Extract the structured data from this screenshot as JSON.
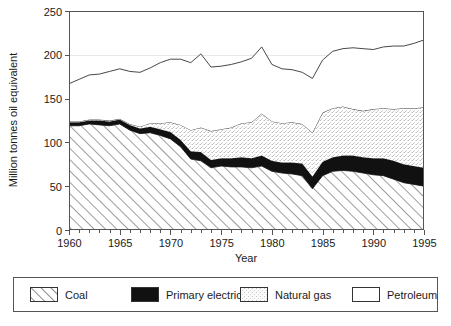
{
  "chart_data": {
    "type": "area",
    "stacked": true,
    "title": "",
    "xlabel": "Year",
    "ylabel": "Million tonnes oil equivalent",
    "xlim": [
      1960,
      1995
    ],
    "ylim": [
      0,
      250
    ],
    "ytick_step": 50,
    "yticks": [
      0,
      50,
      100,
      150,
      200,
      250
    ],
    "ytick_labels": [
      "0",
      "50",
      "100",
      "150",
      "200",
      "250"
    ],
    "xticks": [
      1960,
      1965,
      1970,
      1975,
      1980,
      1985,
      1990,
      1995
    ],
    "xtick_labels": [
      "1960",
      "1965",
      "1970",
      "1975",
      "1980",
      "1985",
      "1990",
      "1995"
    ],
    "xminor_step": 1,
    "grid": "horizontal-faint",
    "legend_position": "below",
    "x": [
      1960,
      1961,
      1962,
      1963,
      1964,
      1965,
      1966,
      1967,
      1968,
      1969,
      1970,
      1971,
      1972,
      1973,
      1974,
      1975,
      1976,
      1977,
      1978,
      1979,
      1980,
      1981,
      1982,
      1983,
      1984,
      1985,
      1986,
      1987,
      1988,
      1989,
      1990,
      1991,
      1992,
      1993,
      1994,
      1995
    ],
    "series": [
      {
        "name": "Coal",
        "pattern": "diagonal-hatch",
        "color": "#ffffff",
        "values": [
          119,
          119,
          121,
          120,
          119,
          121,
          114,
          110,
          111,
          108,
          104,
          95,
          81,
          79,
          71,
          73,
          72,
          72,
          71,
          73,
          67,
          65,
          64,
          62,
          47,
          62,
          67,
          68,
          67,
          65,
          63,
          62,
          58,
          54,
          52,
          50
        ]
      },
      {
        "name": "Primary electricity",
        "pattern": "solid-black",
        "color": "#111111",
        "values": [
          4,
          4,
          4,
          5,
          5,
          5,
          6,
          6,
          7,
          7,
          8,
          8,
          9,
          10,
          9,
          9,
          10,
          11,
          11,
          12,
          12,
          12,
          13,
          14,
          14,
          16,
          16,
          17,
          18,
          18,
          19,
          20,
          21,
          21,
          21,
          21
        ]
      },
      {
        "name": "Natural gas",
        "pattern": "stipple",
        "color": "#f2f2f2",
        "values": [
          1,
          1,
          1,
          1,
          1,
          1,
          1,
          2,
          4,
          7,
          11,
          17,
          24,
          28,
          33,
          33,
          35,
          39,
          41,
          48,
          45,
          45,
          46,
          45,
          50,
          56,
          56,
          56,
          53,
          53,
          56,
          57,
          59,
          64,
          66,
          69
        ]
      },
      {
        "name": "Petroleum",
        "pattern": "white",
        "color": "#ffffff",
        "values": [
          43,
          48,
          51,
          52,
          56,
          57,
          60,
          62,
          63,
          69,
          72,
          75,
          77,
          84,
          73,
          72,
          72,
          70,
          73,
          76,
          65,
          62,
          60,
          59,
          62,
          60,
          65,
          66,
          70,
          71,
          68,
          70,
          72,
          71,
          74,
          77
        ]
      }
    ]
  },
  "legend": {
    "items": [
      {
        "label": "Coal",
        "swatch": "diagonal-hatch"
      },
      {
        "label": "Primary electricity",
        "swatch": "solid-black"
      },
      {
        "label": "Natural gas",
        "swatch": "stipple"
      },
      {
        "label": "Petroleum",
        "swatch": "white"
      }
    ]
  },
  "axes": {
    "ylabel": "Million tonnes oil equivalent",
    "xlabel": "Year"
  }
}
